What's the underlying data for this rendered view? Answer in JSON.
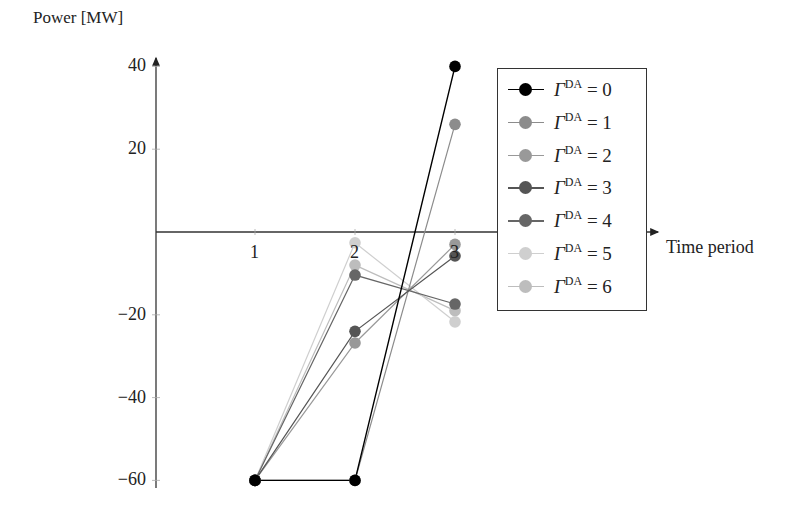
{
  "chart_data": {
    "type": "line",
    "title": "",
    "xlabel": "Time period",
    "ylabel": "Power [MW]",
    "x": [
      1,
      2,
      3
    ],
    "x_ticks": [
      "1",
      "2",
      "3"
    ],
    "y_ticks": [
      "40",
      "20",
      "−20",
      "−40",
      "−60"
    ],
    "ylim": [
      -60,
      40
    ],
    "grid": false,
    "legend_position": "upper right",
    "series": [
      {
        "name": "ΓDA = 0",
        "param": "0",
        "color": "#000000",
        "values": [
          -60,
          -60,
          40
        ]
      },
      {
        "name": "ΓDA = 1",
        "param": "1",
        "color": "#8c8c8c",
        "values": [
          -60,
          -60,
          26
        ]
      },
      {
        "name": "ΓDA = 2",
        "param": "2",
        "color": "#999999",
        "values": [
          -60,
          -26.8,
          -3
        ]
      },
      {
        "name": "ΓDA = 3",
        "param": "3",
        "color": "#555555",
        "values": [
          -60,
          -24,
          -5.8
        ]
      },
      {
        "name": "ΓDA = 4",
        "param": "4",
        "color": "#666666",
        "values": [
          -60,
          -10.4,
          -17.4
        ]
      },
      {
        "name": "ΓDA = 5",
        "param": "5",
        "color": "#cfcfcf",
        "values": [
          -60,
          -2.6,
          -21.7
        ]
      },
      {
        "name": "ΓDA = 6",
        "param": "6",
        "color": "#bdbdbd",
        "values": [
          -60,
          -8,
          -19
        ]
      }
    ]
  },
  "legend": {
    "symbol": "Γ",
    "superscript": "DA",
    "equals": "="
  }
}
